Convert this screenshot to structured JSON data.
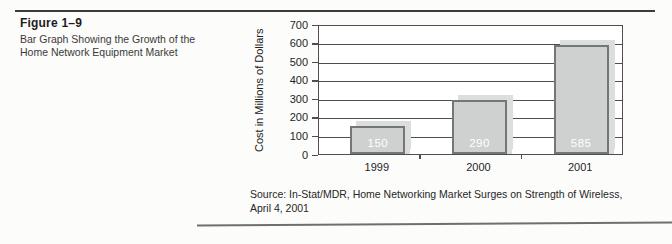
{
  "figure": {
    "label": "Figure 1–9",
    "caption_line1": "Bar Graph Showing the Growth of the",
    "caption_line2": "Home Network Equipment Market"
  },
  "chart_data": {
    "type": "bar",
    "title": "",
    "categories": [
      "1999",
      "2000",
      "2001"
    ],
    "values": [
      150,
      290,
      585
    ],
    "xlabel": "",
    "ylabel": "Cost in Millions of Dollars",
    "ylim": [
      0,
      700
    ],
    "yticks": [
      0,
      100,
      200,
      300,
      400,
      500,
      600,
      700
    ],
    "grid": true,
    "legend": false,
    "value_labels_shown_inside_bars": true,
    "colors": {
      "bar_fill": "#ced1d0",
      "bar_border": "#737777",
      "bar_shadow": "#dcdedd",
      "grid_line": "#4e4e4e",
      "value_label": "#ffffff",
      "plot_background": "#ffffff"
    }
  },
  "source": {
    "line1": "Source: In-Stat/MDR, Home Networking Market Surges on Strength of Wireless,",
    "line2": "April 4, 2001"
  }
}
